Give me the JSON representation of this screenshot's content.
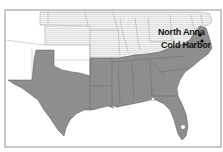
{
  "map": {
    "title": "",
    "colors": {
      "background": "#ffffff",
      "confederate": "#8e8e8e",
      "union": "#f0f0f0",
      "union_hatch": "#d6d6d6",
      "territory": "#ffffff",
      "border": "#5a5a5a",
      "frame": "#777777",
      "marker": "#000000"
    },
    "locations": [
      {
        "name": "North Anna",
        "type": "battle-site"
      },
      {
        "name": "Cold Harbor",
        "type": "battle-site"
      }
    ]
  }
}
